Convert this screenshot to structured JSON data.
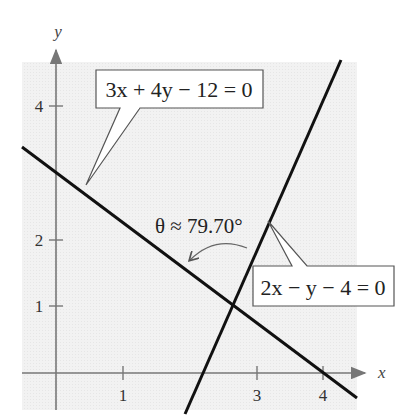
{
  "figure": {
    "axes": {
      "x_label": "x",
      "y_label": "y",
      "x_ticks": [
        "1",
        "3",
        "4"
      ],
      "y_ticks": [
        "1",
        "2",
        "4"
      ]
    },
    "lines": [
      {
        "equation": "3x + 4y − 12 = 0",
        "slope": -0.75,
        "y_intercept": 3,
        "x_intercept": 4
      },
      {
        "equation": "2x − y − 4 = 0",
        "slope": 2,
        "y_intercept": -4,
        "x_intercept": 2
      }
    ],
    "angle_label": "θ ≈ 79.70°",
    "colors": {
      "plot_background": "#f0f0f0",
      "line": "#111111",
      "axis": "#777777",
      "callout_border": "#555555"
    }
  }
}
